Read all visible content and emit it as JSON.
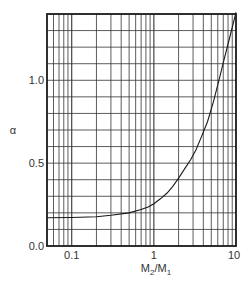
{
  "chart_data": {
    "type": "line",
    "title": "",
    "xlabel": "M2/M1",
    "xlabel_main": "M",
    "xlabel_sub1": "2",
    "xlabel_slash": "/M",
    "xlabel_sub2": "1",
    "ylabel": "α",
    "xscale": "log",
    "xlim": [
      0.05,
      10
    ],
    "ylim": [
      0.0,
      1.4
    ],
    "grid": true,
    "x_ticks": [
      {
        "value": 0.1,
        "label": "0.1"
      },
      {
        "value": 1,
        "label": "1"
      },
      {
        "value": 10,
        "label": "10"
      }
    ],
    "y_ticks": [
      {
        "value": 0.0,
        "label": "0.0"
      },
      {
        "value": 0.5,
        "label": "0.5"
      },
      {
        "value": 1.0,
        "label": "1.0"
      }
    ],
    "series": [
      {
        "name": "alpha",
        "x": [
          0.05,
          0.1,
          0.2,
          0.3,
          0.5,
          0.7,
          0.85,
          1.0,
          1.2,
          1.45,
          1.7,
          2.0,
          2.4,
          2.8,
          3.25,
          3.8,
          4.5,
          5.3,
          6.2,
          7.2,
          8.5,
          10.0
        ],
        "y": [
          0.17,
          0.172,
          0.176,
          0.185,
          0.2,
          0.22,
          0.236,
          0.255,
          0.285,
          0.32,
          0.36,
          0.41,
          0.47,
          0.52,
          0.58,
          0.66,
          0.75,
          0.87,
          1.0,
          1.13,
          1.27,
          1.41
        ]
      }
    ]
  }
}
